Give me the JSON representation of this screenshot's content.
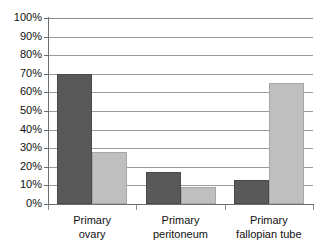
{
  "chart_data": {
    "type": "bar",
    "title": "",
    "subtitle": "",
    "xlabel": "",
    "ylabel": "",
    "ylim": [
      0,
      100
    ],
    "y_unit": "%",
    "grid": true,
    "legend": "none",
    "orientation": "vertical",
    "grouping": "grouped",
    "categories": [
      "Primary ovary",
      "Primary peritoneum",
      "Primary fallopian tube"
    ],
    "category_lines": [
      [
        "Primary",
        "ovary"
      ],
      [
        "Primary",
        "peritoneum"
      ],
      [
        "Primary",
        "fallopian tube"
      ]
    ],
    "series": [
      {
        "name": "series-a",
        "color": "#595959",
        "values": [
          70,
          17,
          13
        ]
      },
      {
        "name": "series-b",
        "color": "#bfbfbf",
        "values": [
          28,
          9,
          65
        ]
      }
    ],
    "y_ticks": [
      {
        "value": 100,
        "label": "100%"
      },
      {
        "value": 90,
        "label": "90%"
      },
      {
        "value": 80,
        "label": "80%"
      },
      {
        "value": 70,
        "label": "70%"
      },
      {
        "value": 60,
        "label": "60%"
      },
      {
        "value": 50,
        "label": "50%"
      },
      {
        "value": 40,
        "label": "40%"
      },
      {
        "value": 30,
        "label": "30%"
      },
      {
        "value": 20,
        "label": "20%"
      },
      {
        "value": 10,
        "label": "10%"
      },
      {
        "value": 0,
        "label": "0%"
      }
    ],
    "colors": {
      "series_a": "#595959",
      "series_b": "#bfbfbf",
      "gridline": "#9a9a9a",
      "axis": "#6e6e6e",
      "background": "#ffffff",
      "text": "#111111"
    }
  }
}
